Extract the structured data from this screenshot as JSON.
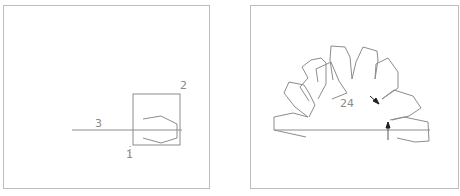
{
  "left_panel": {
    "labels": {
      "one": "1",
      "two": "2",
      "three": "3"
    }
  },
  "right_panel": {
    "labels": {
      "count": "24"
    }
  },
  "colors": {
    "line": "#8c8c8c",
    "border": "#bdbdbd",
    "arrow": "#222222"
  }
}
